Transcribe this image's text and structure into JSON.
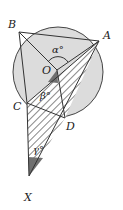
{
  "diagram": {
    "type": "circle-geometry",
    "circle": {
      "center_label": "O",
      "fill": "#dcdcdc"
    },
    "points": {
      "A": "A",
      "B": "B",
      "C": "C",
      "D": "D",
      "O": "O",
      "X": "X"
    },
    "angles": {
      "alpha": "α°",
      "beta": "β°",
      "gamma": "γ°"
    },
    "colors": {
      "circle_fill": "#dcdcdc",
      "shaded": "#707070",
      "hatch": "#444444",
      "line": "#333333"
    }
  }
}
